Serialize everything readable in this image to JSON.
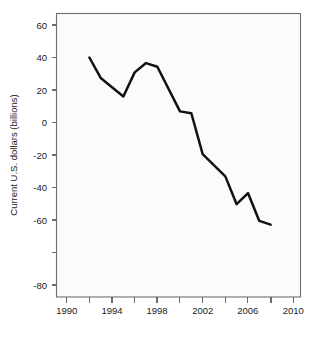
{
  "chart_data": {
    "type": "line",
    "title": "",
    "subtitle": "",
    "xlabel": "",
    "ylabel": "Current U.S. dollars (billions)",
    "xlim": [
      1989.0,
      2011.0
    ],
    "ylim": [
      -88,
      66
    ],
    "grid": false,
    "legend": null,
    "x_ticks": [
      1990,
      1992,
      1994,
      1996,
      1998,
      2000,
      2002,
      2004,
      2006,
      2008,
      2010
    ],
    "x_tick_labels": [
      "1990",
      "",
      "1994",
      "",
      "1998",
      "",
      "2002",
      "",
      "2006",
      "",
      "2010"
    ],
    "x_major_labels": [
      "1990",
      "1994",
      "1998",
      "2002",
      "2006",
      "2010"
    ],
    "y_ticks": [
      60,
      40,
      20,
      0,
      -20,
      -40,
      -60,
      -80
    ],
    "y_tick_labels": [
      "60",
      "40",
      "20",
      "0",
      "-20",
      "-40",
      "-60",
      "-80"
    ],
    "series": [
      {
        "name": "Current U.S. dollars (billions)",
        "color": "#121212",
        "x": [
          1992,
          1993,
          1994,
          1995,
          1996,
          1997,
          1998,
          2000,
          2001,
          2002,
          2004,
          2005,
          2006,
          2007,
          2008
        ],
        "values": [
          35,
          24,
          19,
          14,
          27,
          32,
          30,
          6,
          5,
          -17,
          -29,
          -44,
          -38,
          -53,
          -55
        ]
      }
    ]
  },
  "axes": {
    "y_axis_title": "Current U.S. dollars (billions)"
  }
}
